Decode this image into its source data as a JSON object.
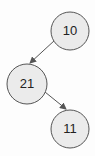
{
  "diagram": {
    "type": "binary-tree",
    "colors": {
      "background": "#fdfdfd",
      "node_fill": "#ebebeb",
      "node_stroke": "#555555",
      "edge": "#555555",
      "text": "#222222"
    },
    "nodes": [
      {
        "id": "n10",
        "label": "10",
        "cx": 70,
        "cy": 31,
        "r": 19
      },
      {
        "id": "n21",
        "label": "21",
        "cx": 27,
        "cy": 84,
        "r": 20
      },
      {
        "id": "n11",
        "label": "11",
        "cx": 70,
        "cy": 129,
        "r": 19
      }
    ],
    "edges": [
      {
        "from": "10",
        "to": "21",
        "directed": true
      },
      {
        "from": "21",
        "to": "11",
        "directed": true
      }
    ]
  }
}
